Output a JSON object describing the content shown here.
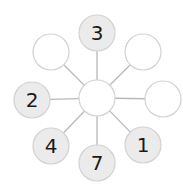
{
  "diagram": {
    "type": "number-bond-star",
    "center": {
      "x": 97,
      "y": 98,
      "r": 18,
      "label": ""
    },
    "colors": {
      "filled": "#ebebeb",
      "empty": "#ffffff",
      "stroke": "#d2d2d2",
      "line": "#b9b9b9",
      "text": "#1a1a1a"
    },
    "nodes": [
      {
        "id": "top",
        "x": 97,
        "y": 33,
        "label": "3",
        "filled": true
      },
      {
        "id": "upper-right",
        "x": 143,
        "y": 52,
        "label": "",
        "filled": false
      },
      {
        "id": "right",
        "x": 163,
        "y": 99,
        "label": "",
        "filled": false
      },
      {
        "id": "lower-right",
        "x": 143,
        "y": 145,
        "label": "1",
        "filled": true
      },
      {
        "id": "bottom",
        "x": 97,
        "y": 163,
        "label": "7",
        "filled": true
      },
      {
        "id": "lower-left",
        "x": 51,
        "y": 146,
        "label": "4",
        "filled": true
      },
      {
        "id": "left",
        "x": 32,
        "y": 100,
        "label": "2",
        "filled": true
      },
      {
        "id": "upper-left",
        "x": 51,
        "y": 52,
        "label": "",
        "filled": false
      }
    ]
  }
}
